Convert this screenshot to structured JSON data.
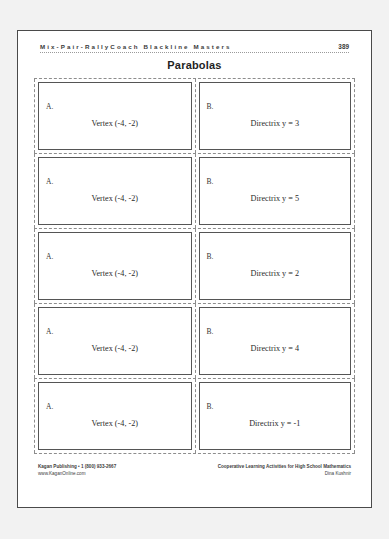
{
  "header": {
    "series_title": "Mix-Pair-RallyCoach Blackline Masters",
    "page_number": "389"
  },
  "title": "Parabolas",
  "cards": [
    {
      "left": {
        "label": "A.",
        "content": "Vertex (-4, -2)"
      },
      "right": {
        "label": "B.",
        "content": "Directrix y = 3"
      }
    },
    {
      "left": {
        "label": "A.",
        "content": "Vertex (-4, -2)"
      },
      "right": {
        "label": "B.",
        "content": "Directrix y = 5"
      }
    },
    {
      "left": {
        "label": "A.",
        "content": "Vertex (-4, -2)"
      },
      "right": {
        "label": "B.",
        "content": "Directrix y = 2"
      }
    },
    {
      "left": {
        "label": "A.",
        "content": "Vertex (-4, -2)"
      },
      "right": {
        "label": "B.",
        "content": "Directrix y = 4"
      }
    },
    {
      "left": {
        "label": "A.",
        "content": "Vertex (-4, -2)"
      },
      "right": {
        "label": "B.",
        "content": "Directrix y = -1"
      }
    }
  ],
  "footer": {
    "publisher": "Kagan Publishing • 1 (800) 933-2667",
    "website": "www.KaganOnline.com",
    "book_title": "Cooperative Learning Activities for High School Mathematics",
    "author": "Dina Kushnir"
  },
  "colors": {
    "page_border": "#4a4a4a",
    "card_border": "#555555",
    "cut_line": "#8d8d8d",
    "text": "#2b2b2b"
  }
}
